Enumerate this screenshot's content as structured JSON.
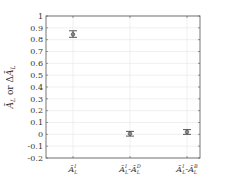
{
  "chart_data": {
    "type": "scatter",
    "title": "",
    "xlabel": "",
    "ylabel": "Ā_L or ΔĀ_L",
    "categories": [
      "Ā_L^I",
      "Ā_L^I-Ā_L^D",
      "Ā_L^I-Ā_L^B"
    ],
    "series": [
      {
        "name": "mean with error bars",
        "values": [
          0.845,
          0.005,
          0.02
        ],
        "error_low": [
          0.82,
          -0.015,
          0.0
        ],
        "error_high": [
          0.875,
          0.025,
          0.04
        ]
      }
    ],
    "ylim": [
      -0.2,
      1.0
    ],
    "yticks": [
      "1",
      "0.9",
      "0.8",
      "0.7",
      "0.6",
      "0.5",
      "0.4",
      "0.3",
      "0.2",
      "0.1",
      "0",
      "-0.1",
      "-0.2"
    ],
    "grid": true,
    "legend": null
  },
  "labels": {
    "ylabel_main": "Ā",
    "ylabel_sub": "L",
    "ylabel_mid": " or Δ",
    "ylabel_main2": "Ā",
    "ylabel_sub2": "L",
    "cat1_main": "Ā",
    "cat1_sup": "I",
    "cat1_sub": "L",
    "cat2_a": "Ā",
    "cat2_a_sup": "I",
    "cat2_a_sub": "L",
    "cat2_dash": "-",
    "cat2_b": "Ā",
    "cat2_b_sup": "D",
    "cat2_b_sub": "L",
    "cat3_a": "Ā",
    "cat3_a_sup": "I",
    "cat3_a_sub": "L",
    "cat3_dash": "-",
    "cat3_b": "Ā",
    "cat3_b_sup": "B",
    "cat3_b_sub": "L"
  },
  "colors": {
    "axis": "#555555",
    "grid": "#e6e6e6",
    "marker": "#444444"
  }
}
